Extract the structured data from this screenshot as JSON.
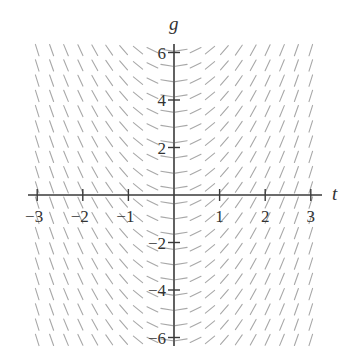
{
  "chart_data": {
    "type": "slope_field",
    "title": "",
    "xlabel": "t",
    "ylabel": "g",
    "xlim": [
      -3.1,
      3.1
    ],
    "ylim": [
      -6.2,
      6.2
    ],
    "x_ticks": [
      -3,
      -2,
      -1,
      1,
      2,
      3
    ],
    "x_tick_labels": [
      "−3",
      "−2",
      "−1",
      "1",
      "2",
      "3"
    ],
    "y_ticks": [
      -6,
      -4,
      -2,
      2,
      4,
      6
    ],
    "y_tick_labels": [
      "−6",
      "−4",
      "−2",
      "2",
      "4",
      "6"
    ],
    "grid": false,
    "slope_depends_on": "t only (segments flat at t=0, steepening as |t| grows; negative slope for t<0, positive for t>0)",
    "approx_equation": "dg/dt = 2t",
    "field_columns": 20,
    "field_rows": 20,
    "segment_color": "#a8a8a8",
    "axis_color": "#3a3a3a"
  }
}
